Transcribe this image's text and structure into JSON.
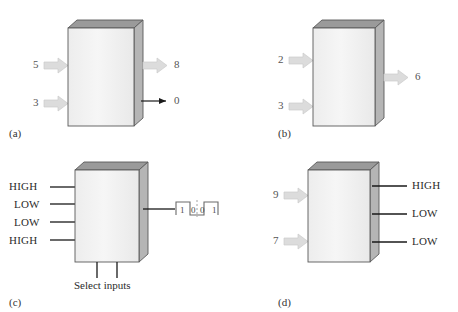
{
  "figure": {
    "background_color": "#ffffff",
    "box_front_color": "#f2f2f2",
    "box_top_color": "#9a9a9a",
    "box_side_color": "#b5b5b5",
    "box_edge_color": "#5a5a5a",
    "block_arrow_color": "#dcdcdc",
    "block_arrow_edge_color": "#c6c6c6",
    "line_color": "#1a1a1a"
  },
  "panels": [
    {
      "tag": "(a)",
      "inputs": [
        {
          "label": "5",
          "style": "block-arrow"
        },
        {
          "label": "3",
          "style": "block-arrow"
        }
      ],
      "outputs": [
        {
          "label": "8",
          "style": "block-arrow"
        },
        {
          "label": "0",
          "style": "line-arrow"
        }
      ]
    },
    {
      "tag": "(b)",
      "inputs": [
        {
          "label": "2",
          "style": "block-arrow"
        },
        {
          "label": "3",
          "style": "block-arrow"
        }
      ],
      "outputs": [
        {
          "label": "6",
          "style": "block-arrow"
        }
      ]
    },
    {
      "tag": "(c)",
      "inputs": [
        {
          "label": "HIGH",
          "style": "line"
        },
        {
          "label": "LOW",
          "style": "line"
        },
        {
          "label": "LOW",
          "style": "line"
        },
        {
          "label": "HIGH",
          "style": "line"
        }
      ],
      "outputs": [
        {
          "label": "",
          "style": "waveform"
        }
      ],
      "select_inputs_caption": "Select inputs",
      "waveform": {
        "digits": [
          "1",
          "0",
          "0",
          "1"
        ],
        "levels": [
          1,
          0,
          0,
          1
        ]
      }
    },
    {
      "tag": "(d)",
      "inputs": [
        {
          "label": "9",
          "style": "block-arrow"
        },
        {
          "label": "7",
          "style": "block-arrow"
        }
      ],
      "outputs": [
        {
          "label": "HIGH",
          "style": "line"
        },
        {
          "label": "LOW",
          "style": "line"
        },
        {
          "label": "LOW",
          "style": "line"
        }
      ]
    }
  ]
}
